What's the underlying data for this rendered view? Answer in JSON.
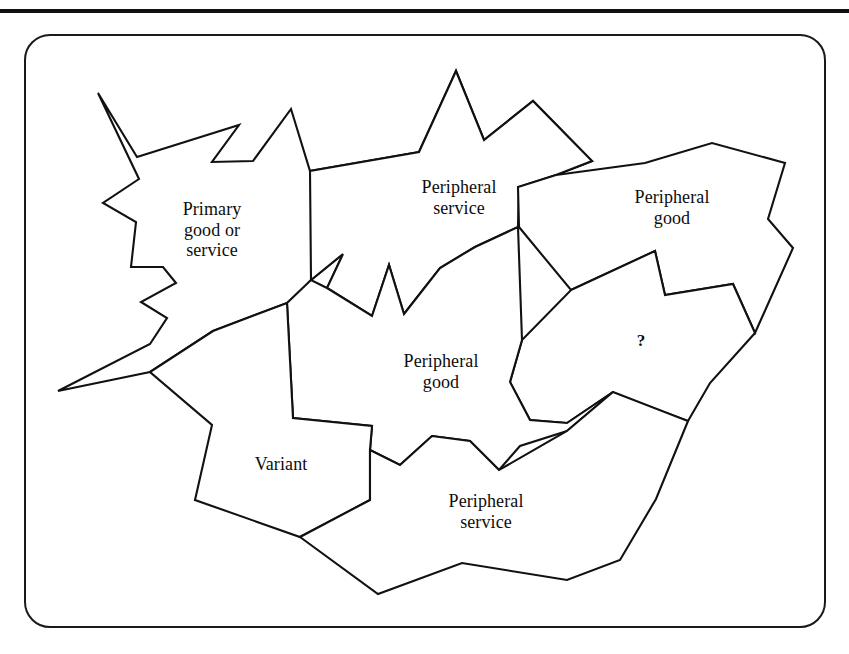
{
  "figure": {
    "frame_color": "#1a1a1a",
    "background": "#ffffff",
    "line_color": "#111111",
    "top_rule_color": "#111111",
    "pieces": [
      {
        "id": "primary-good-or-service",
        "label": "Primary\ngood or\nservice",
        "label_x": 212,
        "label_y": 230,
        "shape": "star-burst",
        "points": "98,93 137,157 239,125 212,162 253,161 291,109 310,171 419,152 456,71 484,140 533,101 592,161 556,175 519,187 518,227 475,247 440,268 404,314 389,265 372,316 327,288 343,254 311,280 293,302 287,303 213,331 150,372 58,391 150,344 167,318 141,302 176,283 163,267 131,267 136,222 103,203 139,179"
      },
      {
        "id": "peripheral-service-top",
        "label": "Peripheral\nservice",
        "label_x": 459,
        "label_y": 198,
        "shape": "star-burst",
        "points": "456,71 484,140 533,101 592,161 556,175 519,187 518,227 475,247 440,268 404,314 389,265 372,316 327,288 343,254 311,280 310,171 419,152"
      },
      {
        "id": "peripheral-good-top-right",
        "label": "Peripheral\ngood",
        "label_x": 672,
        "label_y": 208,
        "shape": "polygon",
        "points": "556,175 645,163 712,143 785,163 768,219 793,248 755,333 733,284 665,295 655,251 571,290 519,227 518,187"
      },
      {
        "id": "question-piece",
        "label": "?",
        "label_x": 641,
        "label_y": 341,
        "shape": "polygon",
        "points": "571,290 655,251 665,295 733,284 755,333 710,383 688,421 612,393 613,392 567,423 530,420 510,382 522,340"
      },
      {
        "id": "peripheral-good-center",
        "label": "Peripheral\ngood",
        "label_x": 441,
        "label_y": 372,
        "shape": "polygon",
        "points": "404,314 440,268 475,247 518,227 522,340 510,382 530,420 567,423 613,392 567,431 520,446 499,470 470,441 432,436 400,465 370,450 372,426 293,418 287,303 311,280 327,288 372,316 389,265"
      },
      {
        "id": "variant",
        "label": "Variant",
        "label_x": 281,
        "label_y": 464,
        "shape": "polygon",
        "points": "287,303 293,418 372,426 370,450 370,500 300,537 195,500 212,425 150,372 213,331"
      },
      {
        "id": "peripheral-service-bottom",
        "label": "Peripheral\nservice",
        "label_x": 486,
        "label_y": 512,
        "shape": "polygon",
        "points": "432,436 470,441 499,470 567,431 613,392 688,421 656,499 620,560 567,580 462,563 378,594 300,537 370,500 370,450 400,465"
      }
    ]
  }
}
